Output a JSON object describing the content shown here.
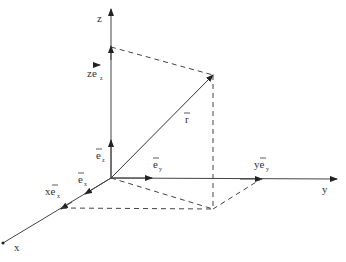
{
  "diagram": {
    "type": "3d-coordinate-system",
    "axes": {
      "x": {
        "label": "x"
      },
      "y": {
        "label": "y"
      },
      "z": {
        "label": "z"
      }
    },
    "unit_vectors": {
      "ex": {
        "base": "e",
        "sub": "x"
      },
      "ey": {
        "base": "e",
        "sub": "y"
      },
      "ez": {
        "base": "e",
        "sub": "z"
      }
    },
    "components": {
      "xex": {
        "coef": "x",
        "base": "e",
        "sub": "x"
      },
      "yey": {
        "coef": "y",
        "base": "e",
        "sub": "y"
      },
      "zez": {
        "coef": "z",
        "base": "e",
        "sub": "z"
      }
    },
    "position_vector": {
      "label": "r"
    },
    "colors": {
      "line": "#333333",
      "dashed": "#444444",
      "background": "#ffffff"
    }
  }
}
